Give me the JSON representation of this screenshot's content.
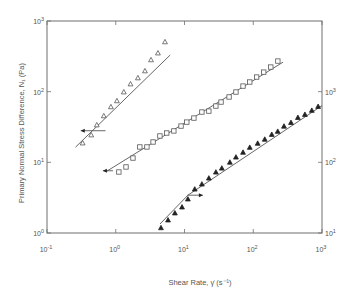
{
  "chart_data": {
    "type": "scatter",
    "title": "",
    "xlabel": "Shear Rate, γ̇ (s⁻¹)",
    "ylabel": "Primary Normal Stress Difference, N₁ (Pa)",
    "xscale": "log",
    "yscale": "log",
    "xlim": [
      0.1,
      1000
    ],
    "ylim": [
      1,
      1000
    ],
    "y2lim": [
      10,
      10000
    ],
    "x_ticks": [
      "10^-1",
      "10^0",
      "10^1",
      "10^2",
      "10^3"
    ],
    "y_ticks_left": [
      "10^0",
      "10^1",
      "10^2",
      "10^3"
    ],
    "y_ticks_right": [
      "10^1",
      "10^2",
      "10^3"
    ],
    "grid": false,
    "legend": null,
    "series": [
      {
        "name": "open triangles",
        "marker": "open-triangle",
        "axis": "left",
        "axis_arrow": "left",
        "x": [
          0.33,
          0.44,
          0.53,
          0.67,
          0.85,
          1.04,
          1.31,
          1.64,
          2.1,
          2.66,
          3.26,
          4.11,
          5.2
        ],
        "y": [
          18.7,
          24.3,
          33.7,
          45.3,
          60.8,
          73.9,
          98.6,
          128,
          156,
          196,
          281,
          351,
          505
        ],
        "fit_line": {
          "x": [
            0.26,
            6.2
          ],
          "y": [
            16.4,
            330
          ]
        },
        "arrow": {
          "from": [
            0.71,
            28
          ],
          "to": [
            0.31,
            28
          ]
        }
      },
      {
        "name": "open squares",
        "marker": "open-square",
        "axis": "left",
        "axis_arrow": "left",
        "x": [
          1.11,
          1.41,
          1.78,
          2.24,
          2.84,
          3.49,
          4.39,
          5.52,
          7.0,
          8.9,
          10.8,
          13.7,
          17.9,
          22.6,
          28.6,
          34,
          44.5,
          56,
          71,
          89,
          112,
          142,
          180,
          228
        ],
        "y": [
          7.3,
          8.6,
          11.5,
          16.5,
          16.5,
          19.4,
          23.6,
          26.0,
          27.8,
          32.6,
          37.1,
          42.3,
          51.5,
          53.1,
          62.6,
          71.3,
          84.1,
          98.8,
          120,
          137,
          161,
          189,
          223,
          271
        ],
        "fit_line": {
          "x": [
            0.74,
            272
          ],
          "y": [
            7.5,
            262
          ]
        },
        "arrow": {
          "from": [
            0.91,
            7.6
          ],
          "to": [
            0.65,
            7.6
          ]
        }
      },
      {
        "name": "filled triangles",
        "marker": "filled-triangle",
        "axis": "right",
        "axis_arrow": "right",
        "x": [
          4.55,
          5.76,
          7.25,
          9.2,
          11.2,
          14.1,
          17.9,
          22.6,
          28.6,
          34.9,
          45.7,
          56,
          71,
          89,
          116,
          147,
          186,
          227,
          280,
          354,
          446,
          564,
          711,
          878
        ],
        "y": [
          11.8,
          15.2,
          19.1,
          23.2,
          30.1,
          41.6,
          49,
          59.5,
          72.4,
          82.3,
          99.9,
          118,
          138,
          162,
          185,
          211,
          247,
          273,
          323,
          364,
          429,
          474,
          541,
          614
        ],
        "fit_line": {
          "x": [
            4.4,
            11.2,
            1000
          ],
          "y": [
            13.4,
            34.3,
            636
          ]
        },
        "arrow": {
          "from": [
            11.0,
            34.3
          ],
          "to": [
            18.5,
            34.3
          ]
        }
      }
    ]
  },
  "labels": {
    "xlabel": "Shear Rate, γ̇ (s⁻¹)",
    "ylabel": "Primary Normal Stress Difference, N₁ (Pa)"
  },
  "colors": {
    "axis": "#6e6e6e",
    "marker": "#555555",
    "line": "#555555"
  }
}
